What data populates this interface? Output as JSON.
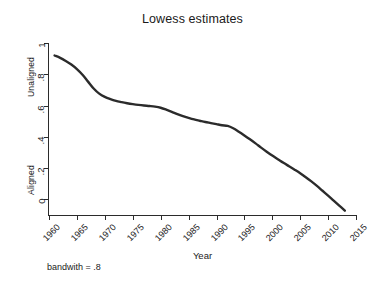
{
  "figure": {
    "title": "Lowess estimates",
    "note": "bandwith = .8",
    "background_color": "#ffffff",
    "line_color": "#2b2b2b",
    "axis_color": "#2b2b2b"
  },
  "chart_data": {
    "type": "line",
    "title": "Lowess estimates",
    "xlabel": "Year",
    "ylabel": "",
    "ylabel_groups": [
      "Unaligned",
      "Aligned"
    ],
    "note": "bandwith = .8",
    "grid": false,
    "legend": "none",
    "xlim": [
      1960,
      2015
    ],
    "ylim": [
      -0.1,
      1.0
    ],
    "xticks": [
      1960,
      1965,
      1970,
      1975,
      1980,
      1985,
      1990,
      1995,
      2000,
      2005,
      2010,
      2015
    ],
    "xticklabels": [
      "1960",
      "1965",
      "1970",
      "1975",
      "1980",
      "1985",
      "1990",
      "1995",
      "2000",
      "2005",
      "2010",
      "2015"
    ],
    "yticks": [
      0,
      0.2,
      0.4,
      0.6,
      0.8,
      1
    ],
    "yticklabels": [
      "0",
      ".2",
      ".4",
      ".6",
      ".8",
      "1"
    ],
    "series": [
      {
        "name": "lowess smooth",
        "x": [
          1961,
          1962,
          1963,
          1964,
          1965,
          1966,
          1967,
          1968,
          1969,
          1970,
          1971,
          1972,
          1973,
          1974,
          1975,
          1976,
          1977,
          1978,
          1979,
          1980,
          1981,
          1982,
          1983,
          1984,
          1985,
          1986,
          1987,
          1988,
          1989,
          1990,
          1991,
          1992,
          1993,
          1994,
          1995,
          1996,
          1997,
          1998,
          1999,
          2000,
          2001,
          2002,
          2003,
          2004,
          2005,
          2006,
          2007,
          2008,
          2009,
          2010,
          2011,
          2012,
          2013
        ],
        "values": [
          0.92,
          0.905,
          0.885,
          0.862,
          0.833,
          0.797,
          0.753,
          0.709,
          0.676,
          0.655,
          0.641,
          0.63,
          0.622,
          0.615,
          0.609,
          0.604,
          0.6,
          0.597,
          0.593,
          0.586,
          0.574,
          0.56,
          0.545,
          0.532,
          0.521,
          0.511,
          0.503,
          0.495,
          0.488,
          0.481,
          0.474,
          0.47,
          0.455,
          0.433,
          0.409,
          0.384,
          0.358,
          0.331,
          0.305,
          0.28,
          0.257,
          0.234,
          0.212,
          0.19,
          0.167,
          0.142,
          0.115,
          0.086,
          0.055,
          0.024,
          -0.008,
          -0.04,
          -0.072
        ]
      }
    ]
  },
  "axes": {
    "y": {
      "ticks": [
        {
          "label": "1",
          "value": 1
        },
        {
          "label": ".8",
          "value": 0.8
        },
        {
          "label": ".6",
          "value": 0.6
        },
        {
          "label": ".4",
          "value": 0.4
        },
        {
          "label": ".2",
          "value": 0.2
        },
        {
          "label": "0",
          "value": 0
        }
      ],
      "group_labels": {
        "upper": "Unaligned",
        "lower": "Aligned"
      }
    },
    "x": {
      "title": "Year",
      "ticks": [
        {
          "label": "1960",
          "value": 1960
        },
        {
          "label": "1965",
          "value": 1965
        },
        {
          "label": "1970",
          "value": 1970
        },
        {
          "label": "1975",
          "value": 1975
        },
        {
          "label": "1980",
          "value": 1980
        },
        {
          "label": "1985",
          "value": 1985
        },
        {
          "label": "1990",
          "value": 1990
        },
        {
          "label": "1995",
          "value": 1995
        },
        {
          "label": "2000",
          "value": 2000
        },
        {
          "label": "2005",
          "value": 2005
        },
        {
          "label": "2010",
          "value": 2010
        },
        {
          "label": "2015",
          "value": 2015
        }
      ]
    }
  }
}
